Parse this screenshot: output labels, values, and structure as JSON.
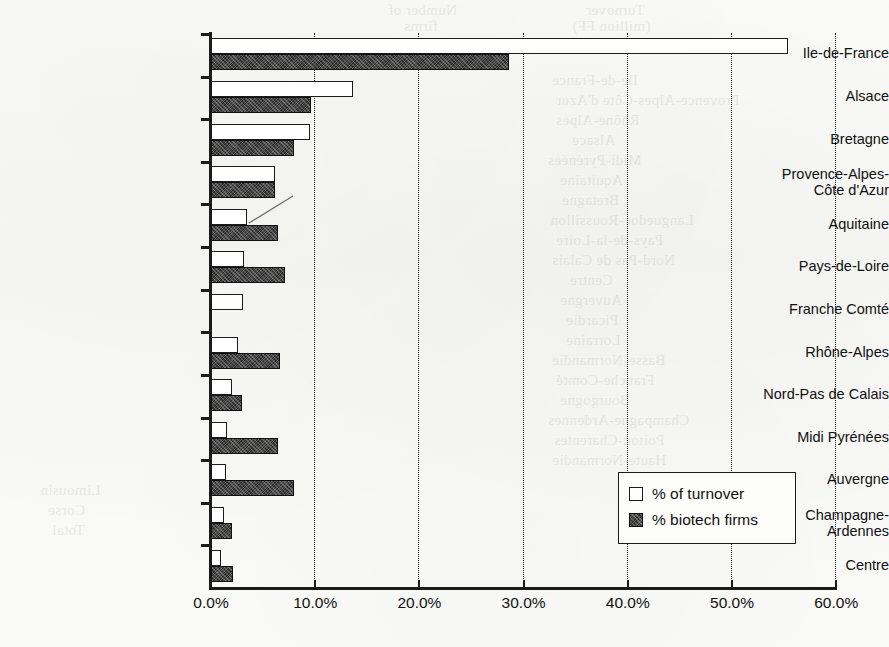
{
  "chart_data": {
    "type": "bar",
    "orientation": "horizontal",
    "title": "",
    "xlabel": "",
    "ylabel": "",
    "xlim": [
      0,
      60
    ],
    "grid": "vertical-dotted",
    "legend_position": "inside-bottom-right",
    "xticks": [
      "0.0%",
      "10.0%",
      "20.0%",
      "30.0%",
      "40.0%",
      "50.0%",
      "60.0%"
    ],
    "xtick_values": [
      0,
      10,
      20,
      30,
      40,
      50,
      60
    ],
    "categories": [
      "Ile-de-France",
      "Alsace",
      "Bretagne",
      "Provence-Alpes-\nCôte d'Azur",
      "Aquitaine",
      "Pays-de-Loire",
      "Franche Comté",
      "Rhône-Alpes",
      "Nord-Pas de Calais",
      "Midi Pyrénées",
      "Auvergne",
      "Champagne-\nArdennes",
      "Centre"
    ],
    "series": [
      {
        "name": "% of turnover",
        "style": "open",
        "values": [
          55.4,
          13.6,
          9.5,
          6.1,
          3.5,
          3.2,
          3.1,
          2.6,
          2.0,
          1.5,
          1.4,
          1.2,
          1.0
        ]
      },
      {
        "name": "% biotech firms",
        "style": "filled",
        "values": [
          28.6,
          9.6,
          8.0,
          6.1,
          6.4,
          7.1,
          0.0,
          6.6,
          3.0,
          6.4,
          8.0,
          2.0,
          2.1
        ]
      }
    ]
  },
  "legend": {
    "items": [
      {
        "label": "% of turnover",
        "style": "open"
      },
      {
        "label": "% biotech firms",
        "style": "filled"
      }
    ]
  },
  "page_background": {
    "note": "scanned book page, faint show-through text from the facing page",
    "ghost_lines": [
      {
        "text": "Number of",
        "x": 388,
        "y": 2
      },
      {
        "text": "Turnover",
        "x": 586,
        "y": 2
      },
      {
        "text": "firms",
        "x": 404,
        "y": 18
      },
      {
        "text": "(million FF)",
        "x": 572,
        "y": 18
      },
      {
        "text": "Ile-de-France",
        "x": 552,
        "y": 72
      },
      {
        "text": "Provence-Alpes-Côte d'Azur",
        "x": 556,
        "y": 92
      },
      {
        "text": "Rhône-Alpes",
        "x": 556,
        "y": 112
      },
      {
        "text": "Alsace",
        "x": 572,
        "y": 132
      },
      {
        "text": "Midi-Pyrénées",
        "x": 548,
        "y": 152
      },
      {
        "text": "Aquitaine",
        "x": 560,
        "y": 172
      },
      {
        "text": "Bretagne",
        "x": 562,
        "y": 192
      },
      {
        "text": "Languedoc-Roussillon",
        "x": 550,
        "y": 212
      },
      {
        "text": "Pays-de-la-Loire",
        "x": 556,
        "y": 232
      },
      {
        "text": "Nord-Pas de Calais",
        "x": 552,
        "y": 252
      },
      {
        "text": "Centre",
        "x": 570,
        "y": 272
      },
      {
        "text": "Auvergne",
        "x": 560,
        "y": 292
      },
      {
        "text": "Picardie",
        "x": 566,
        "y": 312
      },
      {
        "text": "Lorraine",
        "x": 566,
        "y": 332
      },
      {
        "text": "Basse-Normandie",
        "x": 552,
        "y": 352
      },
      {
        "text": "Franche-Comté",
        "x": 556,
        "y": 372
      },
      {
        "text": "Bourgogne",
        "x": 560,
        "y": 392
      },
      {
        "text": "Champagne-Ardennes",
        "x": 548,
        "y": 412
      },
      {
        "text": "Poitou-Charentes",
        "x": 554,
        "y": 432
      },
      {
        "text": "Haute-Normandie",
        "x": 552,
        "y": 452
      },
      {
        "text": "Limousin",
        "x": 40,
        "y": 482
      },
      {
        "text": "Corse",
        "x": 48,
        "y": 502
      },
      {
        "text": "Total",
        "x": 52,
        "y": 522
      }
    ]
  }
}
